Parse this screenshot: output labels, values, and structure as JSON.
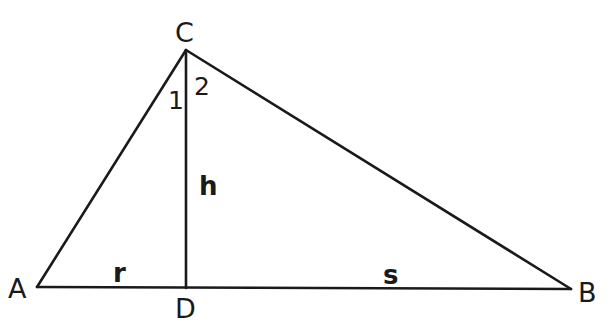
{
  "diagram": {
    "vertices": {
      "A": {
        "label": "A",
        "x": 37,
        "y": 287
      },
      "B": {
        "label": "B",
        "x": 571,
        "y": 289
      },
      "C": {
        "label": "C",
        "x": 186,
        "y": 50
      },
      "D": {
        "label": "D",
        "x": 186,
        "y": 288
      }
    },
    "segments": {
      "AD": {
        "label": "r"
      },
      "DB": {
        "label": "s"
      },
      "CD": {
        "label": "h"
      }
    },
    "angles": {
      "angle_1": {
        "label": "1"
      },
      "angle_2": {
        "label": "2"
      }
    },
    "colors": {
      "stroke": "#1a1a1a",
      "background": "#ffffff"
    }
  }
}
